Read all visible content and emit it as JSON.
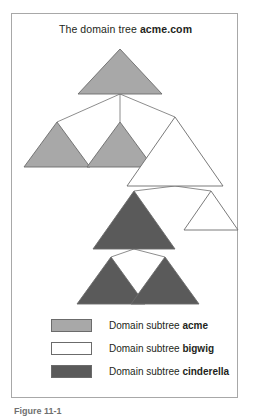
{
  "figure": {
    "title_prefix": "The domain tree ",
    "title_domain": "acme.com",
    "caption": "Figure 11-1"
  },
  "colors": {
    "acme_fill": "#a8a8a8",
    "bigwig_fill": "#ffffff",
    "cinderella_fill": "#5a5a5a",
    "stroke": "#6b6b6b",
    "edge": "#808080",
    "frame": "#a8a8a8",
    "text": "#231f20"
  },
  "legend": {
    "items": [
      {
        "swatch": "acme-swatch",
        "fill": "#a8a8a8",
        "prefix": "Domain subtree ",
        "name": "acme"
      },
      {
        "swatch": "bigwig-swatch",
        "fill": "#ffffff",
        "prefix": "Domain subtree ",
        "name": "bigwig"
      },
      {
        "swatch": "cinderella-swatch",
        "fill": "#5a5a5a",
        "prefix": "Domain subtree ",
        "name": "cinderella"
      }
    ]
  },
  "chart_data": {
    "type": "diagram",
    "title": "The domain tree acme.com",
    "subtrees": [
      "acme",
      "bigwig",
      "cinderella"
    ],
    "nodes": [
      {
        "id": "root",
        "subtree": "acme",
        "apex_x": 108,
        "apex_y": 35,
        "base_y": 80,
        "half_width": 42
      },
      {
        "id": "l1a",
        "subtree": "acme",
        "apex_x": 45,
        "apex_y": 108,
        "base_y": 153,
        "half_width": 33
      },
      {
        "id": "l1b",
        "subtree": "acme",
        "apex_x": 108,
        "apex_y": 108,
        "base_y": 153,
        "half_width": 33
      },
      {
        "id": "l1c",
        "subtree": "bigwig",
        "apex_x": 163,
        "apex_y": 103,
        "base_y": 172,
        "half_width": 48
      },
      {
        "id": "l2a",
        "subtree": "bigwig",
        "apex_x": 199,
        "apex_y": 177,
        "base_y": 216,
        "half_width": 27
      },
      {
        "id": "l2b",
        "subtree": "cinderella",
        "apex_x": 122,
        "apex_y": 177,
        "base_y": 235,
        "half_width": 41
      },
      {
        "id": "l3a",
        "subtree": "cinderella",
        "apex_x": 99,
        "apex_y": 243,
        "base_y": 290,
        "half_width": 34
      },
      {
        "id": "l3b",
        "subtree": "cinderella",
        "apex_x": 153,
        "apex_y": 243,
        "base_y": 290,
        "half_width": 34
      }
    ],
    "edges": [
      {
        "from": "root",
        "to": "l1a"
      },
      {
        "from": "root",
        "to": "l1b"
      },
      {
        "from": "root",
        "to": "l1c"
      },
      {
        "from": "l1c",
        "to": "l2a"
      },
      {
        "from": "l1c",
        "to": "l2b"
      },
      {
        "from": "l2b",
        "to": "l3a"
      },
      {
        "from": "l2b",
        "to": "l3b"
      }
    ]
  }
}
